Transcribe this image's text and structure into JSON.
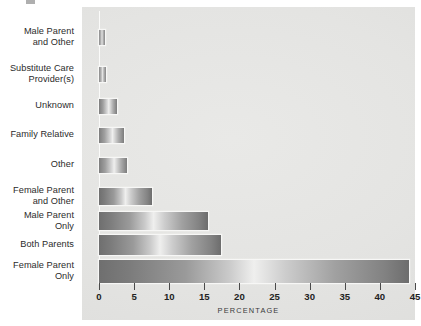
{
  "figure": {
    "background_color": "#ffffff",
    "panel_color": "#e6e6e4",
    "bar_color": "#8c8c8c",
    "axis_title": "PERCENTAGE"
  },
  "chart_data": {
    "type": "bar",
    "orientation": "horizontal",
    "title": "",
    "subtitle": "",
    "xlabel": "PERCENTAGE",
    "ylabel": "",
    "xlim": [
      0,
      45
    ],
    "xticks": [
      0,
      5,
      10,
      15,
      20,
      25,
      30,
      35,
      40,
      45
    ],
    "xtick_labels": [
      "0",
      "5",
      "10",
      "15",
      "20",
      "25",
      "30",
      "35",
      "40",
      "45"
    ],
    "grid": false,
    "legend": null,
    "categories": [
      "Male Parent and Other",
      "Substitute Care Provider(s)",
      "Unknown",
      "Family Relative",
      "Other",
      "Female Parent and Other",
      "Male Parent Only",
      "Both Parents",
      "Female Parent Only"
    ],
    "category_labels_wrapped": [
      [
        "Male Parent",
        "and Other"
      ],
      [
        "Substitute Care",
        "Provider(s)"
      ],
      [
        "Unknown"
      ],
      [
        "Family Relative"
      ],
      [
        "Other"
      ],
      [
        "Female Parent",
        "and Other"
      ],
      [
        "Male Parent",
        "Only"
      ],
      [
        "Both Parents"
      ],
      [
        "Female Parent",
        "Only"
      ]
    ],
    "values": [
      0.8,
      1.0,
      2.6,
      3.5,
      4.0,
      7.6,
      15.5,
      17.4,
      44.2
    ],
    "series": [
      {
        "name": "Percentage",
        "values": [
          0.8,
          1.0,
          2.6,
          3.5,
          4.0,
          7.6,
          15.5,
          17.4,
          44.2
        ]
      }
    ]
  }
}
